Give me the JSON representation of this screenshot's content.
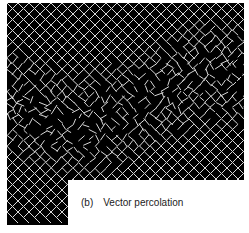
{
  "figure": {
    "panel_label": "(b)",
    "caption": "Vector percolation",
    "colors": {
      "background": "#000000",
      "lattice": "#d8d8d8",
      "label_box": "#ffffff"
    }
  }
}
